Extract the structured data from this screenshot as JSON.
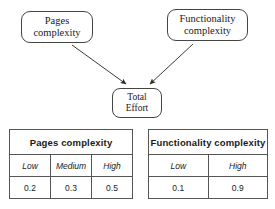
{
  "diagram": {
    "nodes": {
      "pages_complexity": {
        "line1": "Pages",
        "line2": "complexity"
      },
      "functionality_complexity": {
        "line1": "Functionality",
        "line2": "complexity"
      },
      "total_effort": {
        "line1": "Total",
        "line2": "Effort"
      }
    },
    "edges": [
      {
        "from": "Pages complexity",
        "to": "Total Effort"
      },
      {
        "from": "Functionality complexity",
        "to": "Total Effort"
      }
    ]
  },
  "tables": {
    "pages": {
      "title": "Pages complexity",
      "levels": [
        "Low",
        "Medium",
        "High"
      ],
      "values": [
        "0.2",
        "0.3",
        "0.5"
      ]
    },
    "functionality": {
      "title": "Functionality complexity",
      "levels": [
        "Low",
        "High"
      ],
      "values": [
        "0.1",
        "0.9"
      ]
    }
  },
  "colors": {
    "stroke": "#444444",
    "table_border": "#555555",
    "text": "#1a1a1a",
    "background": "#ffffff"
  }
}
